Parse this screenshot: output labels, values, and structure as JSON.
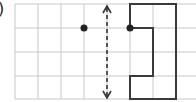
{
  "question_label": ")",
  "grid": {
    "origin_x": 15,
    "origin_y": 4,
    "cell_w": 23,
    "cell_h": 23.75,
    "cols": 8,
    "rows": 4,
    "line_color": "#c8c8c8"
  },
  "mirror_line": {
    "x": 107,
    "y1": 6,
    "y2": 98,
    "style": "dashed",
    "arrows": "both",
    "color": "#333333"
  },
  "points": [
    {
      "name": "left-point",
      "x": 84,
      "y": 28
    },
    {
      "name": "shape-point",
      "x": 130,
      "y": 28
    }
  ],
  "shape": {
    "points": "130,28 130,4 176,4 176,99 130,99 130,76 153,76 153,28 130,28",
    "color": "#333333"
  }
}
